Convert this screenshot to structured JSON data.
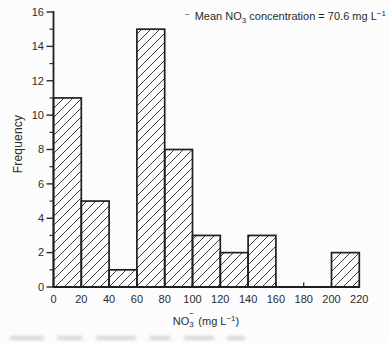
{
  "page": {
    "background": "#fcfcfc",
    "ink": "#2b2b2b"
  },
  "labels": {
    "ylabel": "Frequency",
    "xlabel_parts": {
      "prefix": "NO",
      "sub": "3",
      "sup": "−",
      "mid": " (mg L",
      "exp": "−1",
      "suffix": ")"
    },
    "annotation_parts": {
      "lead_sup": "−",
      "before_sub": "Mean NO",
      "sub": "3",
      "after_sub": " concentration = 70.6 mg L",
      "exp": "−1"
    }
  },
  "chart_data": {
    "type": "bar",
    "subtype": "histogram",
    "title": "",
    "xlabel": "NO3− (mg L−1)",
    "ylabel": "Frequency",
    "annotation": "Mean NO3 concentration = 70.6 mg L−1",
    "mean_value_mg_per_L": 70.6,
    "bin_width": 20,
    "bin_edges": [
      0,
      20,
      40,
      60,
      80,
      100,
      120,
      140,
      160,
      180,
      200,
      220
    ],
    "frequencies": [
      11,
      5,
      1,
      15,
      8,
      3,
      2,
      3,
      0,
      0,
      2
    ],
    "x_ticks": [
      0,
      20,
      40,
      60,
      80,
      100,
      120,
      140,
      160,
      180,
      200,
      220
    ],
    "y_ticks": [
      0,
      2,
      4,
      6,
      8,
      10,
      12,
      14,
      16
    ],
    "y_minor_ticks": [
      1,
      3,
      5,
      7,
      9,
      11,
      13,
      15
    ],
    "xlim": [
      0,
      220
    ],
    "ylim": [
      0,
      16
    ],
    "grid": false,
    "legend": null,
    "bar_fill": "hatched-diagonal",
    "colors": {
      "ink": "#2b2b2b",
      "bar_outline": "#1f1f1f",
      "hatch": "#303030",
      "background": "#fcfcfc"
    }
  }
}
